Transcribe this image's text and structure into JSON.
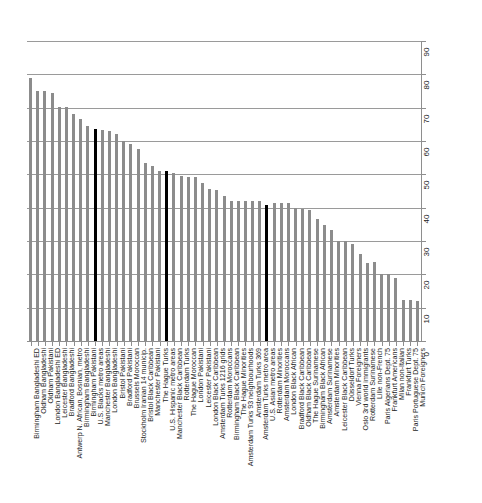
{
  "chart_data": {
    "type": "bar",
    "title": "",
    "subtitle": "",
    "xlabel": "",
    "ylabel": "",
    "ylim": [
      0,
      90
    ],
    "yticks": [
      0,
      10,
      20,
      30,
      40,
      50,
      60,
      70,
      80,
      90
    ],
    "ytick_labels": [
      "0",
      "10",
      "20",
      "30",
      "40",
      "50",
      "60",
      "70",
      "80",
      "90"
    ],
    "grid": true,
    "grid_axis": "y",
    "legend": "none",
    "bar_color": "#8c8c8c",
    "highlight_color": "#000000",
    "highlight_categories": [
      "U.S. Blacks metro areas",
      "U.S. Hispanic metro areas",
      "U.S. Asian metro areas"
    ],
    "categories": [
      "Birmingham Bangladeshi ED",
      "Oldham Bangladeshi",
      "Oldham Pakistani",
      "London Bangladeshi ED",
      "Leicester Bangladeshi",
      "Bradford Bangladeshi",
      "Antwerp N. African, Bosnian, metro",
      "Birmingham Bangladeshi",
      "Birmingham Pakistani",
      "U.S. Blacks metro areas",
      "Manchester Bangladeshi",
      "London Bangladeshi",
      "Bristol Pakistani",
      "Bradford Pakistani",
      "Brussels Moroccan",
      "Stockholm Iranian 14 municip.",
      "Bristol Black Caribbean",
      "Manchester Pakistani",
      "The Hague Turks",
      "U.S. Hispanic metro areas",
      "Manchester Black Caribbean",
      "Rotterdam Turks",
      "The Hague Moroccan",
      "London Pakistani",
      "Leicester Pakistani",
      "London Black Caribbean",
      "Amsterdam Turks 1216 grids",
      "Rotterdam Moroccans",
      "Birmingham Black Caribbean",
      "The Hague Minorities",
      "Amsterdam Turks 93 neighbourhoods",
      "Amsterdam Turks 369",
      "Amsterdam Turks metro area",
      "U.S. Asian metro areas",
      "Rotterdam Minorities",
      "Amsterdam Moroccans",
      "London Black African",
      "Bradford Black Caribbean",
      "Oldham Black Caribbean",
      "The Hague Surinamese",
      "Birmingham Black African",
      "Amsterdam Surinamese",
      "Amsterdam Minorities",
      "Leicester Black Caribbean",
      "Düsseldorf Turks",
      "Vienna Foreigners",
      "Oslo 3rd world immigrants",
      "Rotterdam Surinamese",
      "Lille non-French",
      "Paris Algerians Dept. 75",
      "Frankfurt Americans",
      "Milan non-Italian",
      "Frankfurt Turks",
      "Paris Portuguese Dept. 75",
      "Munich Foreigners"
    ],
    "values": [
      79.0,
      75.0,
      75.0,
      74.3,
      70.2,
      70.2,
      68.0,
      66.6,
      64.5,
      63.5,
      63.2,
      63.0,
      62.0,
      60.0,
      59.0,
      57.5,
      53.5,
      52.6,
      51.0,
      51.0,
      50.5,
      49.5,
      49.3,
      49.3,
      47.4,
      45.5,
      45.3,
      43.6,
      42.0,
      42.0,
      42.0,
      42.0,
      42.0,
      40.8,
      41.5,
      41.5,
      41.5,
      40.0,
      39.5,
      39.3,
      36.5,
      34.8,
      33.3,
      30.0,
      30.0,
      29.2,
      26.2,
      23.5,
      23.6,
      20.0,
      20.0,
      19.0,
      12.2,
      12.2,
      12.0
    ]
  }
}
